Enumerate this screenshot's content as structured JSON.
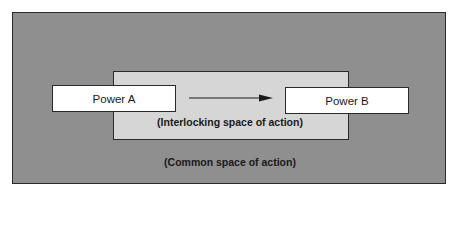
{
  "diagram": {
    "outer_region": {
      "label": "(Common space of action)",
      "fill": "#8f8f8f"
    },
    "inner_region": {
      "label": "(Interlocking space of action)",
      "fill": "#d6d6d6"
    },
    "nodes": [
      {
        "id": "A",
        "label": "Power A"
      },
      {
        "id": "B",
        "label": "Power B"
      }
    ],
    "edges": [
      {
        "from": "A",
        "to": "B",
        "type": "arrow"
      }
    ]
  }
}
